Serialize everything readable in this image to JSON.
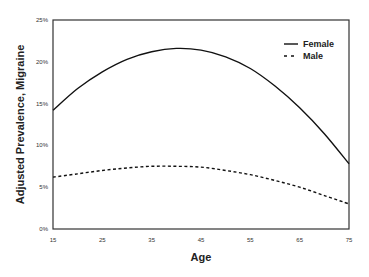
{
  "chart_data": {
    "type": "line",
    "title": "",
    "xlabel": "Age",
    "ylabel": "Adjusted Prevalence, Migraine",
    "xlim": [
      15,
      75
    ],
    "ylim": [
      0,
      25
    ],
    "x_ticks": [
      "15",
      "25",
      "35",
      "45",
      "55",
      "65",
      "75"
    ],
    "y_ticks": [
      "0%",
      "5%",
      "10%",
      "15%",
      "20%",
      "25%"
    ],
    "grid": false,
    "legend_position": "upper right",
    "x": [
      15,
      20,
      25,
      30,
      35,
      40,
      45,
      50,
      55,
      60,
      65,
      70,
      75
    ],
    "series": [
      {
        "name": "Female",
        "style": "solid",
        "values": [
          14.2,
          16.8,
          18.8,
          20.3,
          21.2,
          21.6,
          21.4,
          20.6,
          19.2,
          17.1,
          14.5,
          11.4,
          7.8
        ]
      },
      {
        "name": "Male",
        "style": "dashed",
        "values": [
          6.2,
          6.6,
          7.0,
          7.3,
          7.5,
          7.5,
          7.4,
          7.0,
          6.5,
          5.8,
          5.0,
          4.0,
          3.0
        ]
      }
    ]
  }
}
